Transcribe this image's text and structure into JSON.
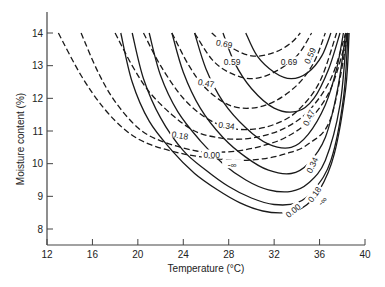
{
  "chart_data": {
    "type": "line",
    "title": "",
    "xlabel": "Temperature (°C)",
    "ylabel": "Moisture content (%)",
    "xlim": [
      12,
      40
    ],
    "ylim": [
      7.5,
      14.5
    ],
    "xticks": [
      12,
      16,
      20,
      24,
      28,
      32,
      36,
      40
    ],
    "yticks": [
      8,
      9,
      10,
      11,
      12,
      13,
      14
    ],
    "grid": false,
    "legend": "none (contour labels inline)",
    "series": [
      {
        "name": "-∞",
        "style": "dashed",
        "x": [
          13,
          15,
          17,
          19,
          21,
          24,
          27,
          29,
          31,
          33,
          35,
          37,
          38.5
        ],
        "y": [
          14,
          12.7,
          11.7,
          11.0,
          10.6,
          10.3,
          10.15,
          10.1,
          10.15,
          10.3,
          10.6,
          11.4,
          14
        ]
      },
      {
        "name": "0.00",
        "style": "dashed",
        "x": [
          15,
          16.5,
          18,
          20,
          22,
          25,
          27,
          29,
          31,
          33,
          35,
          37,
          38.5
        ],
        "y": [
          14,
          12.8,
          11.9,
          11.1,
          10.7,
          10.4,
          10.35,
          10.4,
          10.55,
          10.8,
          11.3,
          12.3,
          14
        ]
      },
      {
        "name": "0.18",
        "style": "dashed",
        "x": [
          18,
          19.5,
          21,
          23,
          25,
          27,
          29,
          31,
          33,
          35,
          37,
          38.3
        ],
        "y": [
          14,
          13.0,
          12.2,
          11.5,
          11.0,
          10.8,
          10.75,
          10.85,
          11.1,
          11.6,
          12.6,
          14
        ]
      },
      {
        "name": "0.34",
        "style": "dashed",
        "x": [
          20.5,
          22,
          24,
          26,
          28,
          30,
          32,
          34,
          36,
          37.5
        ],
        "y": [
          14,
          13.0,
          12.0,
          11.4,
          11.1,
          11.05,
          11.2,
          11.6,
          12.5,
          14
        ]
      },
      {
        "name": "0.47",
        "style": "dashed",
        "x": [
          23,
          24.5,
          26,
          28,
          30,
          32,
          34,
          35.5,
          36.5
        ],
        "y": [
          14,
          13.0,
          12.3,
          11.8,
          11.7,
          11.9,
          12.4,
          13.1,
          14
        ]
      },
      {
        "name": "0.59",
        "style": "dashed",
        "x": [
          25,
          26.5,
          28,
          30,
          32,
          34,
          35.3
        ],
        "y": [
          14,
          13.2,
          12.8,
          12.6,
          12.8,
          13.3,
          14
        ]
      },
      {
        "name": "0.69",
        "style": "dashed",
        "x": [
          26.5,
          28,
          30,
          32,
          33.5,
          34.3
        ],
        "y": [
          14,
          13.6,
          13.3,
          13.4,
          13.7,
          14
        ]
      },
      {
        "name": "-∞",
        "style": "solid",
        "x": [
          18.5,
          19.5,
          21,
          23,
          25,
          27,
          29,
          31,
          33,
          34.5,
          36,
          37.3,
          38.3,
          38.6
        ],
        "y": [
          14,
          12.5,
          11.3,
          10.4,
          9.7,
          9.2,
          8.8,
          8.55,
          8.5,
          8.65,
          9.2,
          10.3,
          12.3,
          14
        ]
      },
      {
        "name": "0.00",
        "style": "solid",
        "x": [
          19.5,
          20.5,
          22,
          24,
          26,
          28,
          30,
          32,
          34,
          35.5,
          37,
          38.1,
          38.5
        ],
        "y": [
          14,
          12.6,
          11.4,
          10.4,
          9.8,
          9.3,
          8.95,
          8.75,
          8.8,
          9.2,
          10.1,
          12.0,
          14
        ]
      },
      {
        "name": "0.18",
        "style": "solid",
        "x": [
          21,
          22,
          23.5,
          25.5,
          27.5,
          29.5,
          31.5,
          33.5,
          35,
          36.5,
          37.8,
          38.4
        ],
        "y": [
          14,
          12.7,
          11.6,
          10.7,
          10.0,
          9.5,
          9.2,
          9.15,
          9.4,
          10.1,
          11.8,
          14
        ]
      },
      {
        "name": "0.34",
        "style": "solid",
        "x": [
          23,
          24,
          25.5,
          27.5,
          29.5,
          31.5,
          33.5,
          35,
          36.5,
          37.6,
          38.3
        ],
        "y": [
          14,
          12.8,
          11.7,
          10.8,
          10.2,
          9.8,
          9.7,
          10.0,
          10.8,
          12.3,
          14
        ]
      },
      {
        "name": "0.47",
        "style": "solid",
        "x": [
          25,
          26,
          27.5,
          29.5,
          31.5,
          33.5,
          35,
          36.5,
          37.5,
          38.1
        ],
        "y": [
          14,
          12.9,
          11.9,
          11.1,
          10.6,
          10.5,
          10.9,
          11.8,
          12.9,
          14
        ]
      },
      {
        "name": "0.59",
        "style": "solid",
        "x": [
          27.5,
          28.5,
          30,
          32,
          34,
          35.5,
          36.8,
          37.8
        ],
        "y": [
          14,
          13.1,
          12.3,
          11.7,
          11.6,
          12.0,
          12.9,
          14
        ]
      },
      {
        "name": "0.69",
        "style": "solid",
        "x": [
          29.5,
          30.5,
          32,
          33.5,
          35,
          36.2,
          37
        ],
        "y": [
          14,
          13.3,
          12.8,
          12.6,
          12.8,
          13.3,
          14
        ]
      }
    ],
    "annotations": [
      {
        "text": "0.69",
        "x": 27.6,
        "y": 13.65,
        "rotate": 12
      },
      {
        "text": "0.59",
        "x": 28.3,
        "y": 13.1,
        "rotate": 0
      },
      {
        "text": "0.47",
        "x": 26.0,
        "y": 12.45,
        "rotate": 10
      },
      {
        "text": "0.34",
        "x": 27.8,
        "y": 11.15,
        "rotate": 8
      },
      {
        "text": "0.18",
        "x": 23.7,
        "y": 10.85,
        "rotate": 10
      },
      {
        "text": "0.00",
        "x": 26.5,
        "y": 10.25,
        "rotate": 0
      },
      {
        "text": "-∞",
        "x": 28.3,
        "y": 9.95,
        "rotate": 0
      },
      {
        "text": "0.69",
        "x": 33.3,
        "y": 13.1,
        "rotate": 0
      },
      {
        "text": "0.59",
        "x": 35.2,
        "y": 13.3,
        "rotate": -65
      },
      {
        "text": "0.47",
        "x": 35.1,
        "y": 11.4,
        "rotate": -65
      },
      {
        "text": "0.34",
        "x": 35.4,
        "y": 9.95,
        "rotate": -65
      },
      {
        "text": "0.18",
        "x": 35.6,
        "y": 9.05,
        "rotate": -55
      },
      {
        "text": "0.00",
        "x": 33.7,
        "y": 8.55,
        "rotate": -40
      },
      {
        "text": "-∞",
        "x": 36.3,
        "y": 8.85,
        "rotate": -45
      }
    ]
  }
}
